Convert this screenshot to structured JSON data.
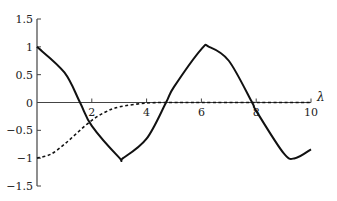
{
  "chart_data": {
    "type": "line",
    "title": "",
    "xlabel": "λ",
    "ylabel": "",
    "xlim": [
      0,
      10
    ],
    "ylim": [
      -1.5,
      1.5
    ],
    "grid": false,
    "legend": null,
    "x_ticks": [
      2,
      4,
      6,
      8,
      10
    ],
    "x_tick_labels": [
      "2",
      "4",
      "6",
      "8",
      "10"
    ],
    "y_ticks": [
      1.5,
      1,
      0.5,
      0,
      -0.5,
      -1,
      -1.5
    ],
    "y_tick_labels": [
      "1.5",
      "1",
      "0.5",
      "0",
      "−0.5",
      "−1",
      "−1.5"
    ],
    "series": [
      {
        "name": "solid",
        "style": "solid",
        "color": "#111111",
        "x": [
          0,
          1,
          1.57,
          2,
          3,
          3.14,
          4,
          4.71,
          5,
          6,
          6.28,
          7,
          7.85,
          8,
          9,
          9.42,
          10
        ],
        "y": [
          1,
          0.54,
          0,
          -0.42,
          -0.99,
          -1,
          -0.65,
          0,
          0.28,
          0.96,
          1,
          0.75,
          0,
          -0.15,
          -0.91,
          -1,
          -0.84
        ]
      },
      {
        "name": "dashed",
        "style": "dashed",
        "color": "#111111",
        "x": [
          0,
          0.5,
          1,
          1.5,
          2,
          2.5,
          3,
          4,
          5,
          6,
          8,
          10
        ],
        "y": [
          -1,
          -0.93,
          -0.75,
          -0.53,
          -0.32,
          -0.17,
          -0.08,
          -0.01,
          0,
          0,
          0,
          0
        ]
      }
    ]
  }
}
